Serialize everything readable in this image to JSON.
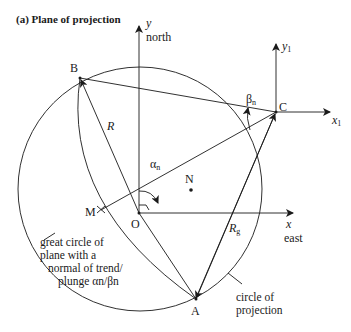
{
  "title": "(a) Plane of projection",
  "axes": {
    "y_label": "y",
    "north_label": "north",
    "x_label": "x",
    "east_label": "east",
    "y1_label": "y",
    "y1_sub": "1",
    "x1_label": "x",
    "x1_sub": "1"
  },
  "points": {
    "A": "A",
    "B": "B",
    "C": "C",
    "O": "O",
    "M": "M",
    "N": "N"
  },
  "symbols": {
    "R": "R",
    "Rg": "R",
    "Rg_sub": "g",
    "alpha_n": "α",
    "alpha_sub": "n",
    "beta_n": "β",
    "beta_sub": "n"
  },
  "annotations": {
    "great_circle": [
      "great circle of",
      "plane with a",
      "normal of trend/",
      "plunge αn/βn"
    ],
    "circle_of_projection": [
      "circle of",
      "projection"
    ]
  },
  "colors": {
    "line": "#1a1a1a",
    "background": "#ffffff"
  }
}
